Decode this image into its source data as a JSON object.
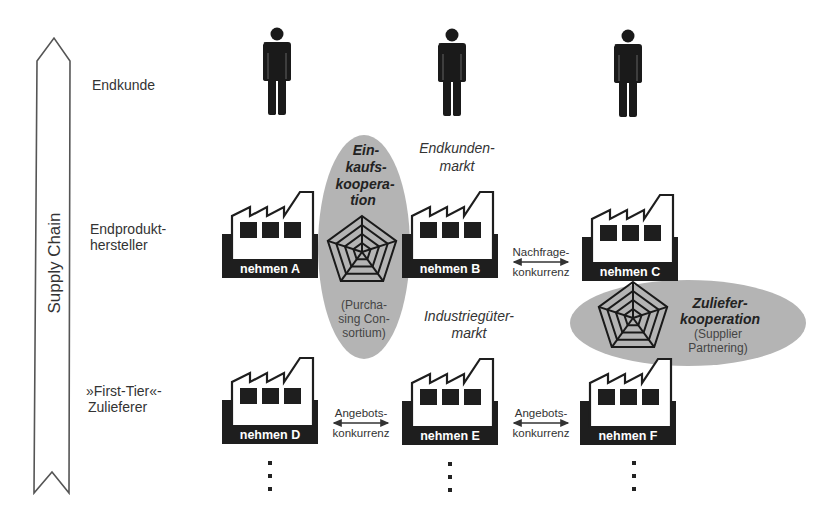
{
  "supply_chain_arrow": {
    "label": "Supply Chain"
  },
  "rows": {
    "endkunde": "Endkunde",
    "endprodukt": [
      "Endprodukt-",
      "hersteller"
    ],
    "first_tier": [
      "»First-Tier«-",
      "Zulieferer"
    ]
  },
  "customers": [
    {
      "icon": "person-icon"
    },
    {
      "icon": "person-icon"
    },
    {
      "icon": "person-icon"
    }
  ],
  "companies": {
    "A": [
      "Unter-",
      "nehmen A"
    ],
    "B": [
      "Unter-",
      "nehmen B"
    ],
    "C": [
      "Unter-",
      "nehmen C"
    ],
    "D": [
      "Unter-",
      "nehmen D"
    ],
    "E": [
      "Unter-",
      "nehmen E"
    ],
    "F": [
      "Unter-",
      "nehmen F"
    ]
  },
  "markets": {
    "endkundenmarkt": [
      "Endkunden-",
      "markt"
    ],
    "industriegueter": [
      "Industriegüter-",
      "markt"
    ]
  },
  "cooperations": {
    "einkauf": {
      "title": [
        "Ein-",
        "kaufs-",
        "koopera-",
        "tion"
      ],
      "subtitle": [
        "(Purcha-",
        "sing Con-",
        "sortium)"
      ]
    },
    "zuliefer": {
      "title": [
        "Zuliefer-",
        "kooperation"
      ],
      "subtitle": [
        "(Supplier",
        "Partnering)"
      ]
    }
  },
  "competition": {
    "nachfrage": [
      "Nachfrage-",
      "konkurrenz"
    ],
    "angebot_de": [
      "Angebots-",
      "konkurrenz"
    ],
    "angebot_ef": [
      "Angebots-",
      "konkurrenz"
    ]
  },
  "colors": {
    "ellipse": "#b4b4b4",
    "factory_base": "#1e1e1e",
    "text": "#333333"
  }
}
